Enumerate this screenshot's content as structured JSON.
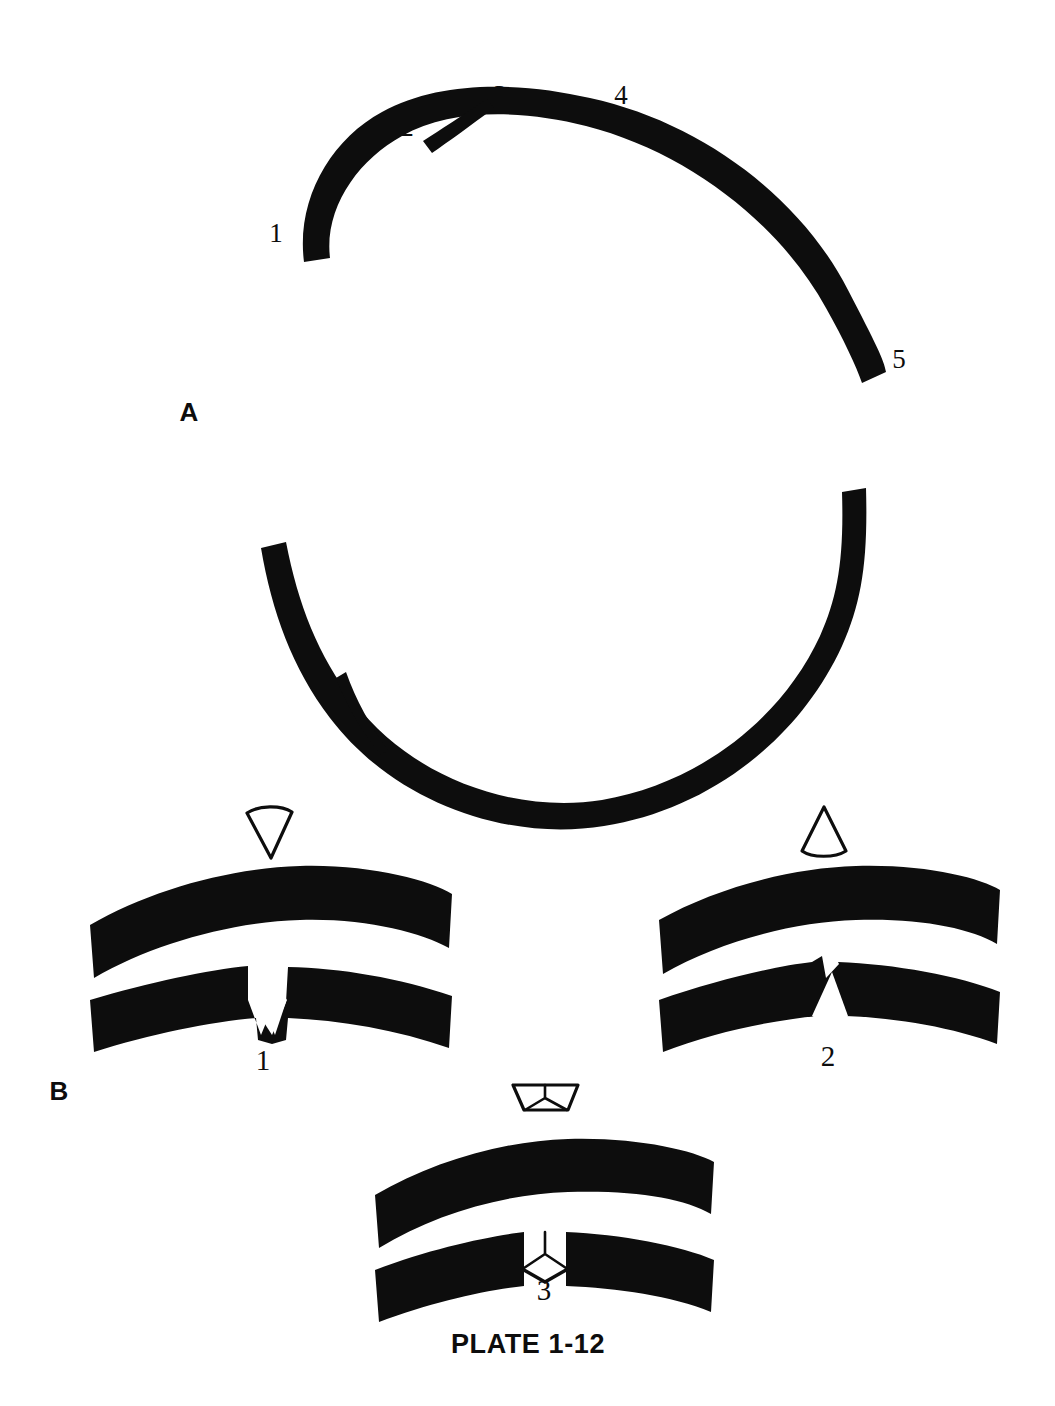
{
  "plate": {
    "caption": "PLATE 1-12",
    "colors": {
      "ink": "#0d0d0d",
      "paper": "#ffffff"
    }
  },
  "sections": [
    {
      "key": "A",
      "label": "A",
      "description": "Interrupted circular arch wire with branch spur; five numbered reference points",
      "callouts": [
        {
          "id": "1",
          "label": "1",
          "x": 283,
          "y": 240
        },
        {
          "id": "2",
          "label": "2",
          "x": 407,
          "y": 133
        },
        {
          "id": "3",
          "label": "3",
          "x": 497,
          "y": 101
        },
        {
          "id": "4",
          "label": "4",
          "x": 620,
          "y": 101
        },
        {
          "id": "5",
          "label": "5",
          "x": 897,
          "y": 365
        }
      ]
    },
    {
      "key": "B",
      "label": "B",
      "description": "Three arch-band segments each with a different wedge of material removed",
      "panels": [
        {
          "id": "1",
          "label": "1",
          "wedge_icon": "inverted-triangle-wedge",
          "wedge_description": "Wedge with apex pointing down and curved wide top edge"
        },
        {
          "id": "2",
          "label": "2",
          "wedge_icon": "upright-triangle-wedge",
          "wedge_description": "Wedge with apex pointing up and curved wide bottom edge"
        },
        {
          "id": "3",
          "label": "3",
          "wedge_icon": "trapezoid-wedge",
          "wedge_description": "Trapezoidal wedge, wider at top, with internal Y division lines"
        }
      ]
    }
  ]
}
